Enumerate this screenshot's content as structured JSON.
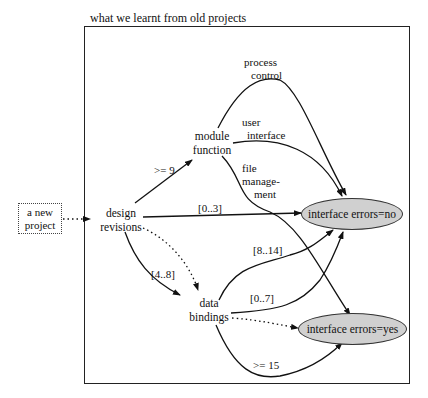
{
  "diagram": {
    "caption": "what we learnt from old projects",
    "start_node": {
      "line1": "a new",
      "line2": "project"
    },
    "nodes": {
      "design_revisions": {
        "line1": "design",
        "line2": "revisions"
      },
      "module_function": {
        "line1": "module",
        "line2": "function"
      },
      "data_bindings": {
        "line1": "data",
        "line2": "bindings"
      }
    },
    "outcomes": {
      "no": "interface errors=no",
      "yes": "interface errors=yes",
      "fill_color": "#d0d0d0"
    },
    "edge_labels": {
      "ge9": ">= 9",
      "r0_3": "[0..3]",
      "r4_8": "[4..8]",
      "r8_14": "[8..14]",
      "r0_7": "[0..7]",
      "ge15": ">= 15",
      "process_control": {
        "line1": "process",
        "line2": "control"
      },
      "user_interface": {
        "line1": "user",
        "line2": "interface"
      },
      "file_management": {
        "line1": "file",
        "line2": "manage-",
        "line3": "ment"
      }
    }
  }
}
